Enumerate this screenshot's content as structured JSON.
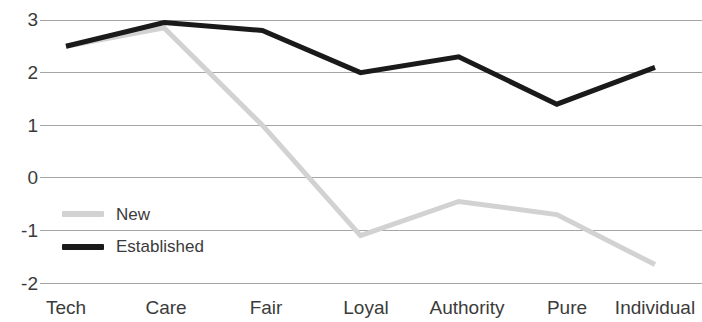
{
  "chart_data": {
    "type": "line",
    "title": "",
    "subtitle": "",
    "xlabel": "",
    "ylabel": "",
    "categories": [
      "Tech",
      "Care",
      "Fair",
      "Loyal",
      "Authority",
      "Pure",
      "Individual"
    ],
    "series": [
      {
        "name": "New",
        "color": "#d2d2d2",
        "values": [
          2.5,
          2.85,
          1.0,
          -1.1,
          -0.45,
          -0.7,
          -1.65
        ]
      },
      {
        "name": "Established",
        "color": "#1a1a1a",
        "values": [
          2.5,
          2.95,
          2.8,
          2.0,
          2.3,
          1.4,
          2.1
        ]
      }
    ],
    "ylim": [
      -2,
      3
    ],
    "yticks": [
      3,
      2,
      1,
      0,
      -1,
      -2
    ],
    "ytick_labels": [
      "3",
      "2",
      "1",
      "0",
      "-1",
      "-2"
    ],
    "grid": true,
    "grid_axis": "y",
    "grid_color": "#a6a6a6",
    "legend_position": "inside-left-lower",
    "legend_entries": [
      {
        "label": "New",
        "color": "#d2d2d2"
      },
      {
        "label": "Established",
        "color": "#1a1a1a"
      }
    ]
  },
  "axes": {
    "y_labels": [
      "3",
      "2",
      "1",
      "0",
      "-1",
      "-2"
    ],
    "x_labels": [
      "Tech",
      "Care",
      "Fair",
      "Loyal",
      "Authority",
      "Pure",
      "Individual"
    ]
  },
  "legend": {
    "items": [
      {
        "label": "New"
      },
      {
        "label": "Established"
      }
    ]
  },
  "colors": {
    "established_line": "#1a1a1a",
    "new_line": "#d2d2d2",
    "gridline": "#a6a6a6",
    "tick_text": "#3b3b3b",
    "background": "#ffffff"
  }
}
